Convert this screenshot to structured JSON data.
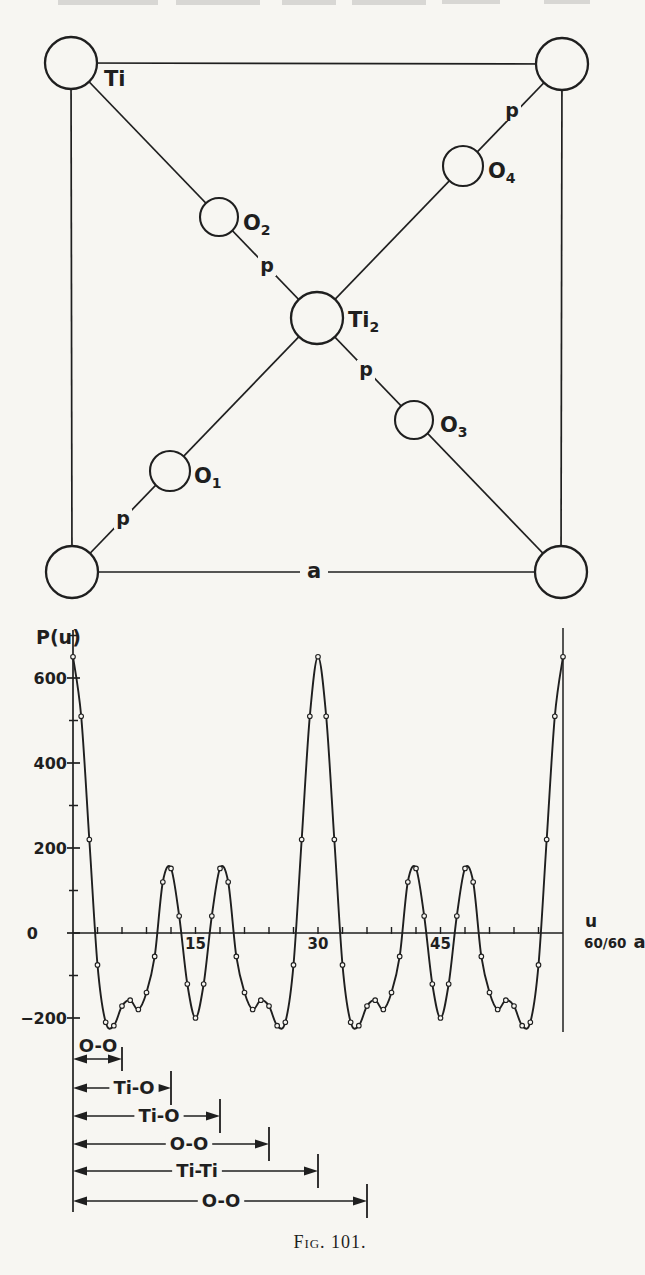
{
  "page": {
    "paper_color": "#f7f6f2",
    "ink_color": "#1f1f1f"
  },
  "caption": {
    "text": "Fig. 101."
  },
  "structure_diagram": {
    "description": "Projection of rutile-type unit cell with Ti at corners and centre, O atoms on diagonals",
    "atoms": [
      {
        "id": "ti-corner-top-left",
        "label": "Ti",
        "sub": "",
        "x": 71,
        "y": 63,
        "r": 26,
        "lx": 104,
        "ly": 86
      },
      {
        "id": "ti-corner-top-right",
        "label": "",
        "sub": "",
        "x": 562,
        "y": 64,
        "r": 26
      },
      {
        "id": "ti-corner-bottom-left",
        "label": "",
        "sub": "",
        "x": 72,
        "y": 572,
        "r": 26
      },
      {
        "id": "ti-corner-bottom-right",
        "label": "",
        "sub": "",
        "x": 561,
        "y": 572,
        "r": 26
      },
      {
        "id": "ti2-centre",
        "label": "Ti",
        "sub": "2",
        "x": 317,
        "y": 318,
        "r": 26,
        "lx": 348,
        "ly": 327
      },
      {
        "id": "o1",
        "label": "O",
        "sub": "1",
        "x": 170,
        "y": 471,
        "r": 20,
        "lx": 194,
        "ly": 483
      },
      {
        "id": "o2",
        "label": "O",
        "sub": "2",
        "x": 219,
        "y": 217,
        "r": 19,
        "lx": 243,
        "ly": 230
      },
      {
        "id": "o3",
        "label": "O",
        "sub": "3",
        "x": 414,
        "y": 420,
        "r": 19,
        "lx": 440,
        "ly": 432
      },
      {
        "id": "o4",
        "label": "O",
        "sub": "4",
        "x": 463,
        "y": 166,
        "r": 20,
        "lx": 488,
        "ly": 178
      }
    ],
    "bond_label": "p",
    "bond_label_positions": [
      {
        "x": 267,
        "y": 272
      },
      {
        "x": 366,
        "y": 376
      },
      {
        "x": 512,
        "y": 117
      },
      {
        "x": 123,
        "y": 525
      }
    ],
    "cell_edge_label": "a",
    "cell_edge_label_pos": {
      "x": 314,
      "y": 578
    }
  },
  "chart_data": {
    "type": "line",
    "title": "",
    "ylabel": "P(u)",
    "xlabel": "u",
    "x_axis_end_fraction": "60/60",
    "x_axis_end_unit": "a",
    "xlim": [
      0,
      60
    ],
    "ylim": [
      -240,
      700
    ],
    "grid": false,
    "marker": "open-circle",
    "x_tick_step": 3,
    "x_ticks_labeled": [
      15,
      30,
      45
    ],
    "y_tick_minor": [
      700,
      500,
      300,
      100,
      -100
    ],
    "y_ticks_labeled": [
      600,
      400,
      200,
      0,
      -200
    ],
    "x": [
      0,
      1,
      2,
      3,
      4,
      5,
      6,
      7,
      8,
      9,
      10,
      11,
      12,
      13,
      14,
      15,
      16,
      17,
      18,
      19,
      20,
      21,
      22,
      23,
      24,
      25,
      26,
      27,
      28,
      29,
      30,
      31,
      32,
      33,
      34,
      35,
      36,
      37,
      38,
      39,
      40,
      41,
      42,
      43,
      44,
      45,
      46,
      47,
      48,
      49,
      50,
      51,
      52,
      53,
      54,
      55,
      56,
      57,
      58,
      59,
      60
    ],
    "values": [
      650,
      510,
      220,
      -75,
      -210,
      -218,
      -172,
      -158,
      -180,
      -140,
      -55,
      120,
      152,
      40,
      -120,
      -200,
      -120,
      40,
      152,
      120,
      -55,
      -140,
      -180,
      -158,
      -172,
      -218,
      -210,
      -75,
      220,
      510,
      650,
      510,
      220,
      -75,
      -210,
      -218,
      -172,
      -158,
      -180,
      -140,
      -55,
      120,
      152,
      40,
      -120,
      -200,
      -120,
      40,
      152,
      120,
      -55,
      -140,
      -180,
      -158,
      -172,
      -218,
      -210,
      -75,
      220,
      510,
      650
    ]
  },
  "distance_annotations": {
    "rows": [
      {
        "label": "O-O",
        "from_u": 0,
        "to_u": 6,
        "y": 1059,
        "label_x": 98,
        "label_above": true,
        "bar_half": 12
      },
      {
        "label": "Ti-O",
        "from_u": 0,
        "to_u": 12,
        "y": 1088,
        "label_x": 134,
        "label_above": false,
        "bar_half": 17
      },
      {
        "label": "Ti-O",
        "from_u": 0,
        "to_u": 18,
        "y": 1116,
        "label_x": 159,
        "label_above": false,
        "bar_half": 17
      },
      {
        "label": "O-O",
        "from_u": 0,
        "to_u": 24,
        "y": 1144,
        "label_x": 189,
        "label_above": false,
        "bar_half": 17
      },
      {
        "label": "Ti-Ti",
        "from_u": 0,
        "to_u": 30,
        "y": 1171,
        "label_x": 197,
        "label_above": false,
        "bar_half": 17
      },
      {
        "label": "O-O",
        "from_u": 0,
        "to_u": 36,
        "y": 1201,
        "label_x": 221,
        "label_above": false,
        "bar_half": 17
      }
    ]
  }
}
